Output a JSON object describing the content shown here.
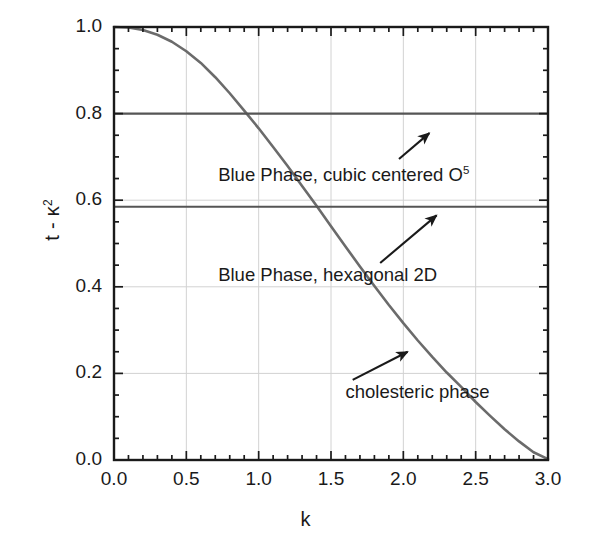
{
  "chart_data": {
    "type": "line",
    "title": "",
    "subtitle": "",
    "xlabel": "k",
    "ylabel": "t - κ²",
    "xlim": [
      0.0,
      3.0
    ],
    "ylim": [
      0.0,
      1.0
    ],
    "grid": true,
    "grid_style": "light gray, major only",
    "legend": "none",
    "x_ticks": [
      "0.0",
      "0.5",
      "1.0",
      "1.5",
      "2.0",
      "2.5",
      "3.0"
    ],
    "x_tick_values": [
      0.0,
      0.5,
      1.0,
      1.5,
      2.0,
      2.5,
      3.0
    ],
    "x_minor_tick_step": 0.1,
    "y_ticks": [
      "0.0",
      "0.2",
      "0.4",
      "0.6",
      "0.8",
      "1.0"
    ],
    "y_tick_values": [
      0.0,
      0.2,
      0.4,
      0.6,
      0.8,
      1.0
    ],
    "y_minor_tick_step": 0.05,
    "series": [
      {
        "name": "phase boundary curve",
        "type": "line",
        "color": "#6b6b6b",
        "points": [
          [
            0.0,
            1.0
          ],
          [
            0.1,
            0.999
          ],
          [
            0.2,
            0.993
          ],
          [
            0.3,
            0.982
          ],
          [
            0.4,
            0.966
          ],
          [
            0.5,
            0.944
          ],
          [
            0.6,
            0.917
          ],
          [
            0.7,
            0.884
          ],
          [
            0.8,
            0.847
          ],
          [
            0.9,
            0.807
          ],
          [
            1.0,
            0.766
          ],
          [
            1.1,
            0.723
          ],
          [
            1.2,
            0.679
          ],
          [
            1.3,
            0.633
          ],
          [
            1.4,
            0.587
          ],
          [
            1.5,
            0.54
          ],
          [
            1.6,
            0.493
          ],
          [
            1.7,
            0.447
          ],
          [
            1.8,
            0.402
          ],
          [
            1.9,
            0.358
          ],
          [
            2.0,
            0.316
          ],
          [
            2.1,
            0.276
          ],
          [
            2.2,
            0.238
          ],
          [
            2.3,
            0.202
          ],
          [
            2.4,
            0.169
          ],
          [
            2.5,
            0.134
          ],
          [
            2.6,
            0.102
          ],
          [
            2.7,
            0.071
          ],
          [
            2.8,
            0.043
          ],
          [
            2.9,
            0.018
          ],
          [
            3.0,
            0.002
          ]
        ]
      },
      {
        "name": "horizontal boundary upper",
        "type": "hline",
        "color": "#555555",
        "y": 0.8,
        "x_from": 0.0,
        "x_to": 3.0
      },
      {
        "name": "horizontal boundary lower",
        "type": "hline",
        "color": "#555555",
        "y": 0.585,
        "x_from": 0.0,
        "x_to": 3.0
      }
    ],
    "annotations": [
      {
        "id": "cubic",
        "text": "Blue Phase, cubic centered O",
        "superscript": "5",
        "text_x": 0.72,
        "text_y": 0.655,
        "arrow_from": [
          1.97,
          0.695
        ],
        "arrow_to": [
          2.18,
          0.755
        ]
      },
      {
        "id": "hexagonal",
        "text": "Blue Phase, hexagonal 2D",
        "superscript": "",
        "text_x": 0.72,
        "text_y": 0.425,
        "arrow_from": [
          1.84,
          0.455
        ],
        "arrow_to": [
          2.23,
          0.565
        ]
      },
      {
        "id": "cholesteric",
        "text": "cholesteric phase",
        "superscript": "",
        "text_x": 1.6,
        "text_y": 0.155,
        "arrow_from": [
          1.65,
          0.185
        ],
        "arrow_to": [
          2.03,
          0.25
        ]
      }
    ]
  }
}
